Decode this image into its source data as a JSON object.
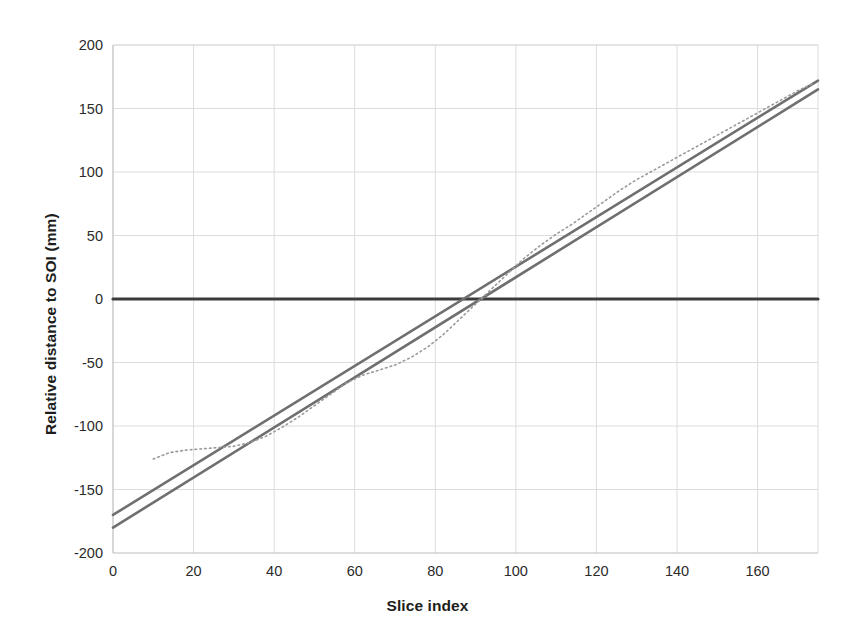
{
  "chart_data": {
    "type": "line",
    "title": "",
    "xlabel": "Slice index",
    "ylabel": "Relative distance to SOI (mm)",
    "xlim": [
      0,
      175
    ],
    "ylim": [
      -200,
      200
    ],
    "xticks": [
      0,
      20,
      40,
      60,
      80,
      100,
      120,
      140,
      160
    ],
    "yticks": [
      -200,
      -150,
      -100,
      -50,
      0,
      50,
      100,
      150,
      200
    ],
    "xtick_labels": [
      "0",
      "20",
      "40",
      "60",
      "80",
      "100",
      "120",
      "140",
      "160"
    ],
    "ytick_labels": [
      "-200",
      "-150",
      "-100",
      "-50",
      "0",
      "50",
      "100",
      "150",
      "200"
    ],
    "grid": true,
    "grid_color": "#dcdcdc",
    "legend": "none",
    "background": "#ffffff",
    "series": [
      {
        "name": "zero-reference",
        "style": "solid",
        "color": "#3b3b3b",
        "width": 3.2,
        "x": [
          0,
          175
        ],
        "values": [
          0,
          0
        ]
      },
      {
        "name": "upper-fit-line",
        "style": "solid",
        "color": "#6f6f6f",
        "width": 2.6,
        "x": [
          0,
          175
        ],
        "values": [
          -170,
          172
        ]
      },
      {
        "name": "lower-fit-line",
        "style": "solid",
        "color": "#6f6f6f",
        "width": 2.6,
        "x": [
          0,
          175
        ],
        "values": [
          -180,
          165
        ]
      },
      {
        "name": "measured-distance",
        "style": "dotted",
        "color": "#9a9a9a",
        "width": 1.6,
        "x": [
          10,
          14,
          18,
          22,
          26,
          30,
          34,
          38,
          42,
          46,
          50,
          54,
          58,
          62,
          66,
          70,
          74,
          78,
          82,
          86,
          90,
          94,
          98,
          102,
          106,
          110,
          114,
          118,
          122,
          126,
          130,
          134,
          138,
          142,
          146,
          150,
          154,
          158,
          162,
          166,
          170,
          174
        ],
        "values": [
          -126,
          -121,
          -119,
          -118,
          -117,
          -116,
          -113,
          -108,
          -101,
          -93,
          -84,
          -75,
          -66,
          -60,
          -56,
          -52,
          -46,
          -38,
          -28,
          -16,
          -4,
          8,
          20,
          32,
          42,
          51,
          59,
          68,
          77,
          86,
          94,
          101,
          108,
          115,
          122,
          129,
          136,
          143,
          150,
          157,
          164,
          170
        ]
      }
    ]
  },
  "plot": {
    "area": {
      "left": 113,
      "top": 45,
      "right": 818,
      "bottom": 553
    }
  }
}
